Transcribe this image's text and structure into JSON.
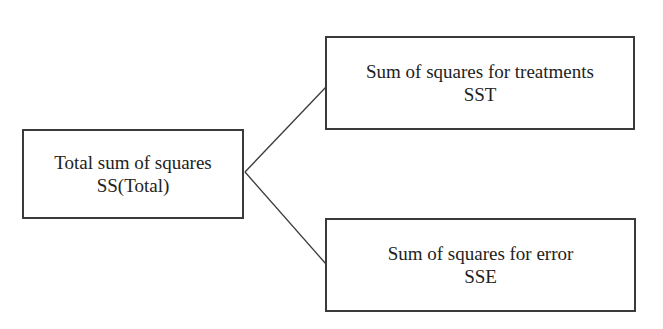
{
  "diagram": {
    "root": {
      "label": "Total sum of squares",
      "symbol": "SS(Total)"
    },
    "children": [
      {
        "label": "Sum of squares for treatments",
        "symbol": "SST"
      },
      {
        "label": "Sum of squares for error",
        "symbol": "SSE"
      }
    ],
    "colors": {
      "line": "#3a3a3a",
      "text": "#222222",
      "background": "#ffffff"
    }
  }
}
